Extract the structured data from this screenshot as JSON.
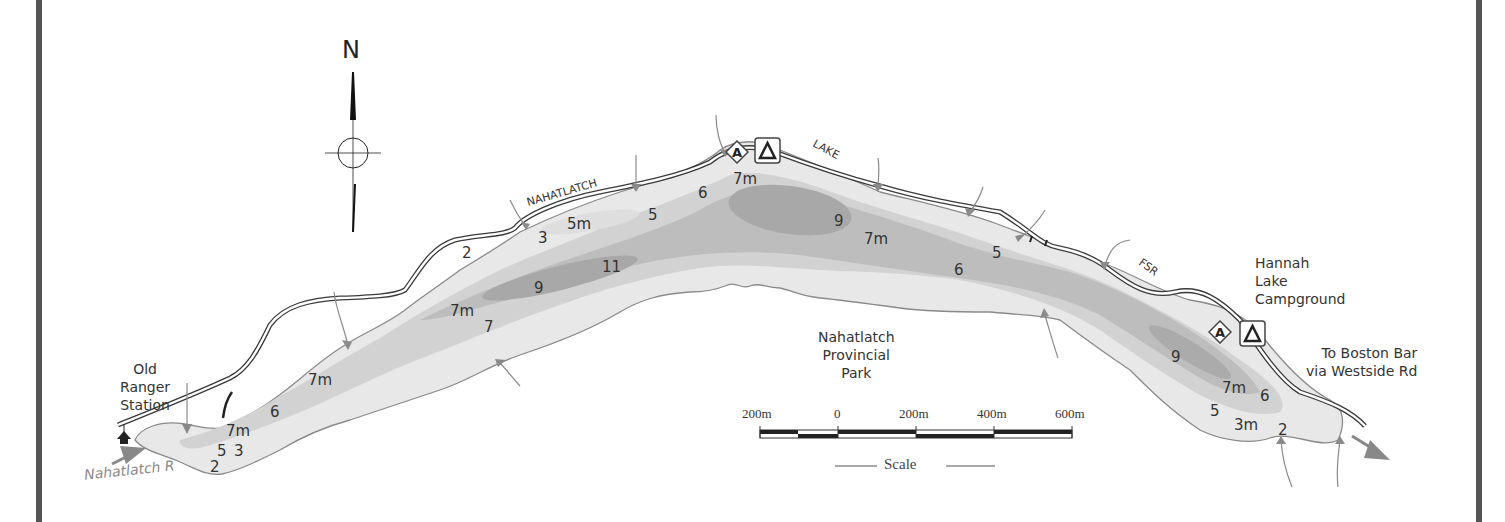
{
  "map": {
    "title": "Nahatlatch Lake",
    "north_label": "N",
    "park_label": [
      "Nahatlatch",
      "Provincial",
      "Park"
    ],
    "road_labels": {
      "nahatlatch": "NAHATLATCH",
      "lake": "LAKE",
      "fsr": "FSR"
    },
    "places": {
      "old_ranger_station": [
        "Old",
        "Ranger",
        "Station"
      ],
      "hannah_lake_campground": [
        "Hannah",
        "Lake",
        "Campground"
      ],
      "to_boston_bar": [
        "To Boston Bar",
        "via Westside Rd"
      ],
      "river": "Nahatlatch R"
    },
    "depths": [
      {
        "label": "2",
        "x": 210,
        "y": 458
      },
      {
        "label": "5",
        "x": 217,
        "y": 442
      },
      {
        "label": "3",
        "x": 234,
        "y": 442
      },
      {
        "label": "7m",
        "x": 226,
        "y": 422
      },
      {
        "label": "6",
        "x": 270,
        "y": 403
      },
      {
        "label": "7m",
        "x": 308,
        "y": 371
      },
      {
        "label": "7m",
        "x": 450,
        "y": 302
      },
      {
        "label": "7",
        "x": 484,
        "y": 318
      },
      {
        "label": "9",
        "x": 534,
        "y": 279
      },
      {
        "label": "11",
        "x": 602,
        "y": 258
      },
      {
        "label": "2",
        "x": 462,
        "y": 244
      },
      {
        "label": "3",
        "x": 538,
        "y": 229
      },
      {
        "label": "5m",
        "x": 567,
        "y": 215
      },
      {
        "label": "5",
        "x": 648,
        "y": 206
      },
      {
        "label": "6",
        "x": 698,
        "y": 184
      },
      {
        "label": "7m",
        "x": 733,
        "y": 170
      },
      {
        "label": "9",
        "x": 834,
        "y": 212
      },
      {
        "label": "7m",
        "x": 864,
        "y": 230
      },
      {
        "label": "6",
        "x": 954,
        "y": 261
      },
      {
        "label": "5",
        "x": 992,
        "y": 244
      },
      {
        "label": "9",
        "x": 1171,
        "y": 348
      },
      {
        "label": "7m",
        "x": 1222,
        "y": 379
      },
      {
        "label": "6",
        "x": 1260,
        "y": 387
      },
      {
        "label": "5",
        "x": 1210,
        "y": 402
      },
      {
        "label": "3m",
        "x": 1234,
        "y": 416
      },
      {
        "label": "2",
        "x": 1278,
        "y": 421
      }
    ],
    "scale": {
      "ticks": [
        "200m",
        "0",
        "200m",
        "400m",
        "600m"
      ],
      "title": "Scale"
    },
    "icons": {
      "boat_launch": "A",
      "campground": "Λ"
    },
    "colors": {
      "frame": "#555555",
      "road": "#3a3a3a",
      "shore": "#8a8a8a",
      "stream": "#8a8a8a",
      "depth_shallow": "#e4e4e4",
      "depth_mid": "#cfcfcf",
      "depth_deep": "#b5b5b5",
      "depth_deepest": "#a3a3a3"
    }
  }
}
